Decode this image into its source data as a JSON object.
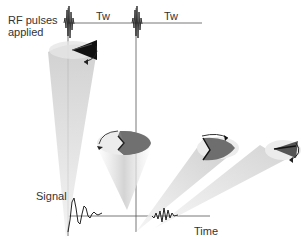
{
  "labels": {
    "rf_pulses_line1": "RF pulses",
    "rf_pulses_line2": "applied",
    "tw_1": "Tw",
    "tw_2": "Tw",
    "signal": "Signal",
    "time": "Time"
  },
  "colors": {
    "line": "#555555",
    "cone": "#c8c8c8",
    "spin_dark": "#1a1a1a",
    "spin_mid": "#6e6e6e",
    "disk_light": "#dcdcdc"
  },
  "timeline": {
    "pulse_positions_x": [
      68,
      136
    ],
    "tw_segments": [
      "Tw",
      "Tw"
    ],
    "stages": [
      "aligned-precession",
      "dephased-half",
      "partially-rephased",
      "nearly-rephased"
    ]
  }
}
